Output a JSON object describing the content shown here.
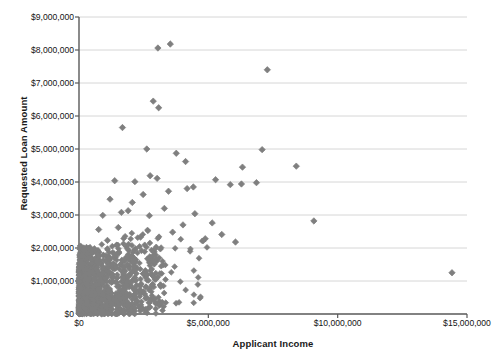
{
  "chart_data": {
    "type": "scatter",
    "title": "",
    "xlabel": "Applicant Income",
    "ylabel": "Requested Loan Amount",
    "xlim": [
      0,
      15000000
    ],
    "ylim": [
      0,
      9000000
    ],
    "grid": true,
    "legend": false,
    "marker": {
      "shape": "diamond",
      "color": "#7f7f7f",
      "size": 5
    },
    "x_ticks": [
      {
        "value": 0,
        "label": "$0"
      },
      {
        "value": 5000000,
        "label": "$5,000,000"
      },
      {
        "value": 10000000,
        "label": "$10,000,000"
      },
      {
        "value": 15000000,
        "label": "$15,000,000"
      }
    ],
    "y_ticks": [
      {
        "value": 0,
        "label": "$0"
      },
      {
        "value": 1000000,
        "label": "$1,000,000"
      },
      {
        "value": 2000000,
        "label": "$2,000,000"
      },
      {
        "value": 3000000,
        "label": "$3,000,000"
      },
      {
        "value": 4000000,
        "label": "$4,000,000"
      },
      {
        "value": 5000000,
        "label": "$5,000,000"
      },
      {
        "value": 6000000,
        "label": "$6,000,000"
      },
      {
        "value": 7000000,
        "label": "$7,000,000"
      },
      {
        "value": 8000000,
        "label": "$8,000,000"
      },
      {
        "value": 9000000,
        "label": "$9,000,000"
      }
    ],
    "notable_points": [
      {
        "x": 3050000,
        "y": 8060000
      },
      {
        "x": 3530000,
        "y": 8180000
      },
      {
        "x": 7280000,
        "y": 7400000
      },
      {
        "x": 2870000,
        "y": 6450000
      },
      {
        "x": 3080000,
        "y": 6250000
      },
      {
        "x": 1680000,
        "y": 5650000
      },
      {
        "x": 2620000,
        "y": 5000000
      },
      {
        "x": 7080000,
        "y": 4980000
      },
      {
        "x": 3760000,
        "y": 4870000
      },
      {
        "x": 4120000,
        "y": 4620000
      },
      {
        "x": 8400000,
        "y": 4480000
      },
      {
        "x": 6320000,
        "y": 4450000
      },
      {
        "x": 2750000,
        "y": 4190000
      },
      {
        "x": 3020000,
        "y": 4110000
      },
      {
        "x": 5280000,
        "y": 4070000
      },
      {
        "x": 1380000,
        "y": 4040000
      },
      {
        "x": 2160000,
        "y": 4010000
      },
      {
        "x": 6860000,
        "y": 3980000
      },
      {
        "x": 6280000,
        "y": 3940000
      },
      {
        "x": 5850000,
        "y": 3920000
      },
      {
        "x": 4420000,
        "y": 3850000
      },
      {
        "x": 4180000,
        "y": 3800000
      },
      {
        "x": 3460000,
        "y": 3720000
      },
      {
        "x": 2480000,
        "y": 3620000
      },
      {
        "x": 1200000,
        "y": 3480000
      },
      {
        "x": 2060000,
        "y": 3380000
      },
      {
        "x": 3300000,
        "y": 3200000
      },
      {
        "x": 1900000,
        "y": 3130000
      },
      {
        "x": 1640000,
        "y": 3080000
      },
      {
        "x": 4480000,
        "y": 3040000
      },
      {
        "x": 920000,
        "y": 2990000
      },
      {
        "x": 2720000,
        "y": 2980000
      },
      {
        "x": 9080000,
        "y": 2820000
      },
      {
        "x": 5150000,
        "y": 2760000
      },
      {
        "x": 4020000,
        "y": 2700000
      },
      {
        "x": 1520000,
        "y": 2620000
      },
      {
        "x": 760000,
        "y": 2560000
      },
      {
        "x": 3620000,
        "y": 2480000
      },
      {
        "x": 5520000,
        "y": 2410000
      },
      {
        "x": 2380000,
        "y": 2330000
      },
      {
        "x": 4880000,
        "y": 2280000
      },
      {
        "x": 1100000,
        "y": 2230000
      },
      {
        "x": 6050000,
        "y": 2180000
      },
      {
        "x": 14420000,
        "y": 1250000
      }
    ],
    "cluster_description": "Dense cluster of several hundred loan applications concentrated below $2,000,000 requested loan amount with applicant income under $3,000,000",
    "n_points_approx": 900
  }
}
